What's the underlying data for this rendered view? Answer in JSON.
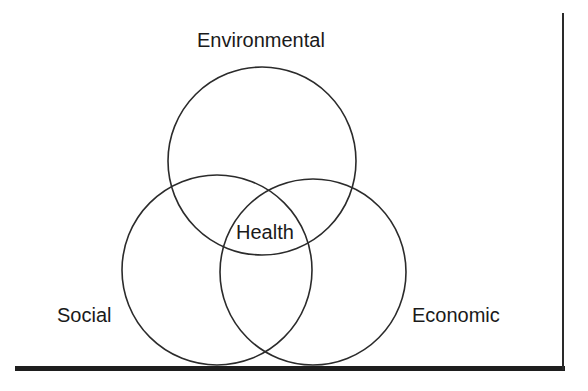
{
  "diagram": {
    "type": "venn",
    "labels": {
      "top": "Environmental",
      "center": "Health",
      "left": "Social",
      "right": "Economic"
    },
    "circles": [
      {
        "name": "Environmental",
        "cx": 262,
        "cy": 161,
        "r": 94
      },
      {
        "name": "Social",
        "cx": 217,
        "cy": 270,
        "r": 95
      },
      {
        "name": "Economic",
        "cx": 313,
        "cy": 272,
        "r": 93
      }
    ],
    "colors": {
      "stroke": "#2b2b2b",
      "text": "#1a1a1a",
      "background": "#ffffff",
      "axis": "#1e1e1e"
    },
    "baseline": {
      "x1": 15,
      "x2": 565,
      "y": 368,
      "thickness": 5
    },
    "right_line": {
      "x": 563,
      "y1": 13,
      "y2": 368,
      "thickness": 2
    }
  }
}
